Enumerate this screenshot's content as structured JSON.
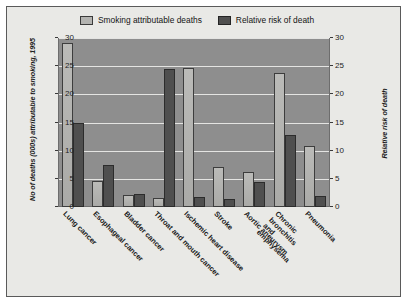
{
  "figure": {
    "frame_color": "#5a5a5a",
    "background": "#e9e9e6",
    "plot_background": "#8e8e8e"
  },
  "legend": {
    "items": [
      {
        "label": "Smoking attributable deaths",
        "swatch": "light-grey-swatch",
        "color": "#b3b3b0"
      },
      {
        "label": "Relative risk of death",
        "swatch": "dark-grey-swatch",
        "color": "#4f4f4f"
      }
    ]
  },
  "axes": {
    "left_title": "No of deaths (000s) attributable to smoking, 1995",
    "right_title": "Relative risk of death",
    "ticks": [
      "0",
      "5",
      "10",
      "15",
      "20",
      "25",
      "30"
    ]
  },
  "chart_data": {
    "type": "bar",
    "title": "",
    "xlabel": "",
    "ylabel": "No of deaths (000s) attributable to smoking, 1995",
    "y2label": "Relative risk of death",
    "ylim": [
      0,
      30
    ],
    "y2lim": [
      0,
      30
    ],
    "ytick_step": 5,
    "grid": true,
    "legend_position": "top-inside",
    "categories": [
      "Lung cancer",
      "Esophageal cancer",
      "Bladder cancer",
      "Throat and mouth cancer",
      "Ischemic heart disease",
      "Stroke",
      "Aortic aneurysm",
      "Chronic bronchitis and emphysema",
      "Pneumonia"
    ],
    "series": [
      {
        "name": "Smoking attributable deaths",
        "axis": "left",
        "color": "#b3b3b0",
        "values": [
          29.2,
          4.7,
          2.1,
          1.6,
          24.7,
          7.1,
          6.2,
          23.8,
          10.8
        ]
      },
      {
        "name": "Relative risk of death",
        "axis": "right",
        "color": "#4f4f4f",
        "values": [
          15.0,
          7.4,
          2.3,
          24.5,
          1.7,
          1.5,
          4.5,
          12.7,
          2.0
        ]
      }
    ]
  }
}
